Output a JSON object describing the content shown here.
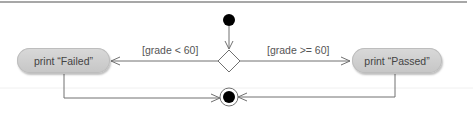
{
  "diagram": {
    "type": "UML activity diagram",
    "nodes": {
      "initial": {
        "kind": "initial-node"
      },
      "decision": {
        "kind": "decision-node"
      },
      "failed": {
        "kind": "action",
        "label": "print “Failed”"
      },
      "passed": {
        "kind": "action",
        "label": "print “Passed”"
      },
      "final": {
        "kind": "final-node"
      }
    },
    "edges": [
      {
        "from": "initial",
        "to": "decision",
        "guard": ""
      },
      {
        "from": "decision",
        "to": "failed",
        "guard": "[grade < 60]"
      },
      {
        "from": "decision",
        "to": "passed",
        "guard": "[grade >= 60]"
      },
      {
        "from": "failed",
        "to": "final",
        "guard": ""
      },
      {
        "from": "passed",
        "to": "final",
        "guard": ""
      }
    ]
  },
  "labels": {
    "failed_action": "print “Failed”",
    "passed_action": "print “Passed”",
    "guard_fail": "[grade < 60]",
    "guard_pass": "[grade >= 60]"
  },
  "colors": {
    "line": "#707070",
    "node_fill": "#000000",
    "action_fill": "#d0d0d0",
    "text": "#555555"
  }
}
